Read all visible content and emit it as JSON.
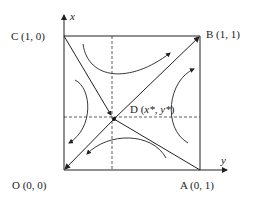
{
  "diagram": {
    "type": "phase-diagram",
    "axes": {
      "vertical_label": "x",
      "horizontal_label": "y"
    },
    "points": {
      "O": {
        "label": "O (0, 0)"
      },
      "A": {
        "label": "A (0, 1)"
      },
      "B": {
        "label": "B (1, 1)"
      },
      "C": {
        "label": "C (1, 0)"
      },
      "D": {
        "prefix": "D (",
        "x": "x*",
        "sep": ", ",
        "y": "y*",
        "suffix": ")"
      }
    },
    "colors": {
      "line": "#222222",
      "background": "#ffffff"
    }
  }
}
